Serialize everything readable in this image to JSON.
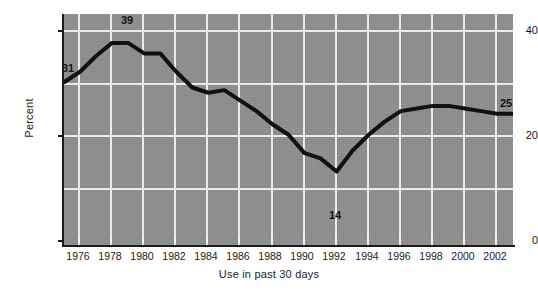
{
  "chart_data": {
    "type": "line",
    "title": "",
    "subtitle": "",
    "xlabel": "Use in past 30 days",
    "ylabel": "Percent",
    "xlim": [
      1975,
      2003
    ],
    "ylim": [
      0,
      44
    ],
    "ytick_values": [
      0,
      20,
      40
    ],
    "ytick_labels": [
      "0",
      "20",
      "40"
    ],
    "xtick_labels": [
      "1976",
      "1978",
      "1980",
      "1982",
      "1984",
      "1986",
      "1988",
      "1990",
      "1992",
      "1994",
      "1996",
      "1998",
      "2000",
      "2002"
    ],
    "xtick_values": [
      1976,
      1978,
      1980,
      1982,
      1984,
      1986,
      1988,
      1990,
      1992,
      1994,
      1996,
      1998,
      2000,
      2002
    ],
    "grid": true,
    "grid_color": "#efefef",
    "vertical_gridlines_at": [
      1976,
      1978,
      1980,
      1982,
      1984,
      1986,
      1988,
      1990,
      1992,
      1994,
      1996,
      1998,
      2000,
      2002
    ],
    "horizontal_gridlines_at": [
      10,
      20,
      30,
      40
    ],
    "panel_background": "#8f8f8f",
    "line_color": "#111111",
    "line_width": 4,
    "legend": null,
    "x": [
      1975,
      1976,
      1977,
      1978,
      1979,
      1980,
      1981,
      1982,
      1983,
      1984,
      1985,
      1986,
      1987,
      1988,
      1989,
      1990,
      1991,
      1992,
      1993,
      1994,
      1995,
      1996,
      1997,
      1998,
      1999,
      2000,
      2001,
      2002,
      2003
    ],
    "values": [
      31,
      33,
      36,
      38.5,
      38.5,
      36.5,
      36.5,
      33,
      30,
      29,
      29.5,
      27.5,
      25.5,
      23,
      21,
      17.5,
      16.5,
      14,
      18,
      21,
      23.5,
      25.5,
      26,
      26.5,
      26.5,
      26,
      25.5,
      25,
      25
    ],
    "annotations": [
      {
        "label": "31",
        "x": 1975,
        "y": 31,
        "position": "above-left"
      },
      {
        "label": "39",
        "x": 1978.5,
        "y": 38.5,
        "position": "above"
      },
      {
        "label": "14",
        "x": 1992,
        "y": 14,
        "position": "below"
      },
      {
        "label": "25",
        "x": 2003,
        "y": 25,
        "position": "above-right"
      }
    ]
  },
  "axes": {
    "y_title": "Percent",
    "x_title": "Use in past 30 days",
    "y_labels": [
      "40",
      "20",
      "0"
    ],
    "x_labels": [
      "1976",
      "1978",
      "1980",
      "1982",
      "1984",
      "1986",
      "1988",
      "1990",
      "1992",
      "1994",
      "1996",
      "1998",
      "2000",
      "2002"
    ]
  },
  "callouts": {
    "start": "31",
    "peak": "39",
    "trough": "14",
    "end": "25"
  }
}
